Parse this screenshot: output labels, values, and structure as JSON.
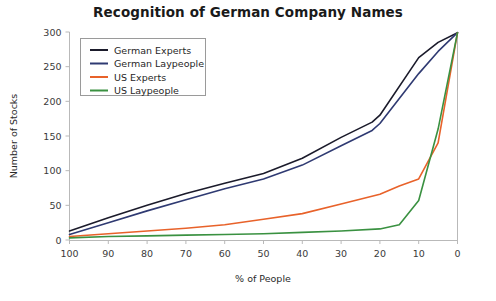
{
  "chart_data": {
    "type": "line",
    "title": "Recognition of German Company Names",
    "xlabel": "% of People",
    "ylabel": "Number of Stocks",
    "xlim": [
      100,
      0
    ],
    "ylim": [
      0,
      300
    ],
    "xticks": [
      100,
      90,
      80,
      70,
      60,
      50,
      40,
      30,
      20,
      10,
      0
    ],
    "yticks": [
      0,
      50,
      100,
      150,
      200,
      250,
      300
    ],
    "grid": false,
    "legend_position": "upper-left",
    "x_axis_reversed": true,
    "series": [
      {
        "name": "German Experts",
        "color": "#1b1b2b",
        "x": [
          100,
          90,
          80,
          70,
          60,
          50,
          40,
          30,
          22,
          20,
          10,
          5,
          0
        ],
        "values": [
          13,
          32,
          50,
          67,
          82,
          96,
          118,
          148,
          170,
          180,
          263,
          285,
          299
        ]
      },
      {
        "name": "German Laypeople",
        "color": "#2f3a72",
        "x": [
          100,
          90,
          80,
          70,
          60,
          50,
          40,
          30,
          22,
          20,
          10,
          5,
          0
        ],
        "values": [
          8,
          25,
          42,
          58,
          74,
          88,
          108,
          136,
          158,
          168,
          240,
          272,
          299
        ]
      },
      {
        "name": "US Experts",
        "color": "#e8622a",
        "x": [
          100,
          90,
          80,
          70,
          60,
          50,
          40,
          30,
          20,
          15,
          10,
          5,
          0
        ],
        "values": [
          5,
          9,
          13,
          17,
          22,
          30,
          38,
          52,
          66,
          78,
          88,
          140,
          299
        ]
      },
      {
        "name": "US Laypeople",
        "color": "#3a9141",
        "x": [
          100,
          90,
          80,
          70,
          60,
          50,
          40,
          30,
          20,
          15,
          10,
          5,
          0
        ],
        "values": [
          3,
          5,
          6,
          7,
          8,
          9,
          11,
          13,
          16,
          22,
          57,
          160,
          299
        ]
      }
    ]
  },
  "legend": {
    "entries": [
      {
        "label": "German Experts"
      },
      {
        "label": "German Laypeople"
      },
      {
        "label": "US Experts"
      },
      {
        "label": "US Laypeople"
      }
    ]
  }
}
